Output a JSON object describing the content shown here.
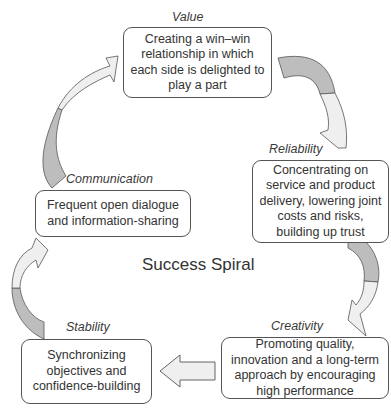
{
  "diagram": {
    "title": "Success Spiral",
    "stages": [
      {
        "key": "value",
        "label": "Value",
        "text": "Creating a win–win relationship in which each side is delighted to play a part"
      },
      {
        "key": "reliability",
        "label": "Reliability",
        "text": "Concentrating on service and product delivery, lowering joint costs and risks, building up trust"
      },
      {
        "key": "creativity",
        "label": "Creativity",
        "text": "Promoting quality, innovation and a long-term approach by encouraging high performance"
      },
      {
        "key": "stability",
        "label": "Stability",
        "text": "Synchronizing objectives and confidence-building"
      },
      {
        "key": "communication",
        "label": "Communication",
        "text": "Frequent open dialogue and information-sharing"
      }
    ],
    "colors": {
      "arrow_dark": "#bdbdbd",
      "arrow_light": "#efefef",
      "stroke": "#555555"
    }
  }
}
